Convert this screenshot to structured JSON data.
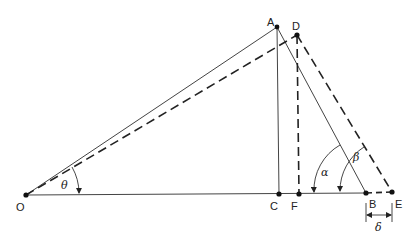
{
  "diagram": {
    "type": "geometry",
    "points": {
      "O": {
        "label": "O",
        "x": 26,
        "y": 195
      },
      "A": {
        "label": "A",
        "x": 277,
        "y": 27
      },
      "D": {
        "label": "D",
        "x": 297,
        "y": 35
      },
      "C": {
        "label": "C",
        "x": 279,
        "y": 194
      },
      "F": {
        "label": "F",
        "x": 299,
        "y": 194
      },
      "B": {
        "label": "B",
        "x": 366,
        "y": 193
      },
      "E": {
        "label": "E",
        "x": 392,
        "y": 192
      }
    },
    "angles": {
      "theta": "θ",
      "alpha": "α",
      "beta": "β"
    },
    "dimension": {
      "delta": "δ",
      "from": "B",
      "to": "E"
    },
    "colors": {
      "line": "#222222",
      "background": "#ffffff"
    }
  }
}
